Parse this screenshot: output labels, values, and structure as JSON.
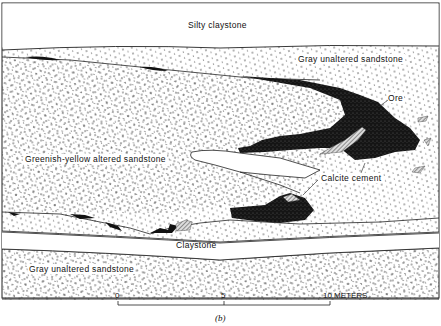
{
  "figure": {
    "caption": "(b)",
    "type": "geologic cross-section"
  },
  "labels": {
    "silty_claystone": "Silty claystone",
    "gray_sandstone_upper": "Gray unaltered sandstone",
    "ore": "Ore",
    "greenish_yellow": "Greenish-yellow altered sandstone",
    "calcite_cement": "Calcite cement",
    "claystone": "Claystone",
    "gray_sandstone_lower": "Gray unaltered sandstone"
  },
  "scale_bar": {
    "ticks": [
      "0",
      "5",
      "10 METERS"
    ],
    "unit": "METERS",
    "max": 10
  },
  "colors": {
    "ore": "#111111",
    "line": "#222222",
    "dots": "#333333",
    "background": "#ffffff"
  }
}
